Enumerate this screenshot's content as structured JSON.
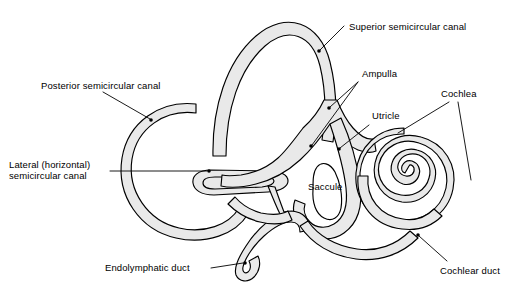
{
  "figure": {
    "background_color": "#ffffff",
    "duct_fill_color": "#e9e9e9",
    "outline_color": "#000000",
    "width": 516,
    "height": 290
  },
  "labels": {
    "superior_semicircular_canal": "Superior semicircular canal",
    "posterior_semicircular_canal": "Posterior semicircular canal",
    "lateral_semicircular_canal_line1": "Lateral (horizontal)",
    "lateral_semicircular_canal_line2": "semicircular canal",
    "ampulla": "Ampulla",
    "utricle": "Utricle",
    "cochlea": "Cochlea",
    "saccule": "Saccule",
    "endolymphatic_duct": "Endolymphatic duct",
    "cochlear_duct": "Cochlear duct"
  }
}
